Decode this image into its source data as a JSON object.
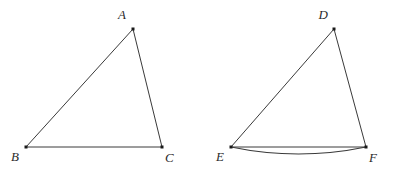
{
  "figure": {
    "background_color": "#ffffff",
    "stroke_color": "#3a3a3a",
    "vertex_color": "#1a1a1a",
    "label_color": "#2b2b2b",
    "shapes": [
      {
        "id": "triangle-abc",
        "name": "triangle-abc",
        "type": "triangle",
        "vertices": [
          {
            "label": "A",
            "x": 133,
            "y": 29,
            "label_x": 126,
            "label_y": 19,
            "anchor": "end"
          },
          {
            "label": "B",
            "x": 26,
            "y": 147,
            "label_x": 19,
            "label_y": 161,
            "anchor": "end"
          },
          {
            "label": "C",
            "x": 162,
            "y": 147,
            "label_x": 165,
            "label_y": 162,
            "anchor": "start"
          }
        ],
        "edges": [
          {
            "name": "edge-ab",
            "from": "A",
            "to": "B"
          },
          {
            "name": "edge-ac",
            "from": "A",
            "to": "C"
          },
          {
            "name": "edge-bc",
            "from": "B",
            "to": "C"
          }
        ],
        "arcs": []
      },
      {
        "id": "triangle-def",
        "name": "triangle-def",
        "type": "triangle",
        "vertices": [
          {
            "label": "D",
            "x": 334,
            "y": 29,
            "label_x": 328,
            "label_y": 19,
            "anchor": "end"
          },
          {
            "label": "E",
            "x": 231,
            "y": 147,
            "label_x": 224,
            "label_y": 161,
            "anchor": "end"
          },
          {
            "label": "F",
            "x": 366,
            "y": 147,
            "label_x": 369,
            "label_y": 162,
            "anchor": "start"
          }
        ],
        "edges": [
          {
            "name": "edge-de",
            "from": "D",
            "to": "E"
          },
          {
            "name": "edge-df",
            "from": "D",
            "to": "F"
          },
          {
            "name": "edge-ef",
            "from": "E",
            "to": "F"
          }
        ],
        "arcs": [
          {
            "name": "arc-ef",
            "from": "E",
            "to": "F",
            "sag_px": 7,
            "direction": "downward",
            "path": "M 231 147 Q 298.5 161 366 147"
          }
        ]
      }
    ]
  }
}
